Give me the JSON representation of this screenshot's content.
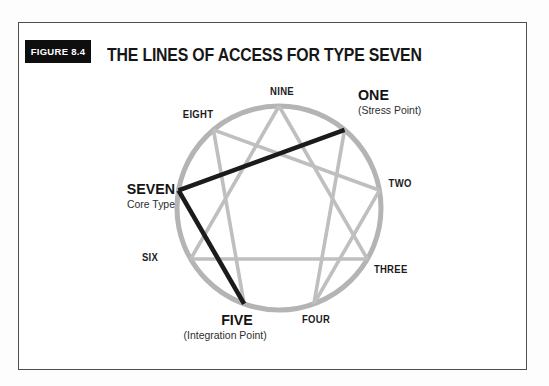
{
  "figure": {
    "tag": "FIGURE 8.4",
    "title": "THE LINES OF ACCESS FOR TYPE SEVEN"
  },
  "enneagram": {
    "core_type": "SEVEN",
    "stress_point": "ONE",
    "integration_point": "FIVE",
    "points": [
      {
        "number": "9",
        "label": "NINE"
      },
      {
        "number": "1",
        "label": "ONE",
        "sublabel": "(Stress Point)"
      },
      {
        "number": "2",
        "label": "TWO"
      },
      {
        "number": "3",
        "label": "THREE"
      },
      {
        "number": "4",
        "label": "FOUR"
      },
      {
        "number": "5",
        "label": "FIVE",
        "sublabel": "(Integration Point)"
      },
      {
        "number": "6",
        "label": "SIX"
      },
      {
        "number": "7",
        "label": "SEVEN",
        "sublabel": "Core Type"
      },
      {
        "number": "8",
        "label": "EIGHT"
      }
    ],
    "gray_connections": [
      [
        1,
        4
      ],
      [
        4,
        2
      ],
      [
        2,
        8
      ],
      [
        8,
        5
      ],
      [
        9,
        3
      ],
      [
        3,
        6
      ],
      [
        6,
        9
      ]
    ],
    "black_connections": [
      [
        7,
        1
      ],
      [
        7,
        5
      ]
    ],
    "colors": {
      "circle": "#b4b4b4",
      "gray_line": "#bfbfbf",
      "black_line": "#1b1b1b"
    }
  }
}
